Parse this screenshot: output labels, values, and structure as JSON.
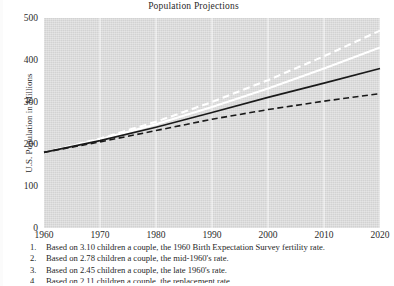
{
  "chart_data": {
    "type": "line",
    "title": "Population Projections",
    "xlabel": "",
    "ylabel": "U.S. Population in Millions",
    "xlim": [
      1960,
      2020
    ],
    "ylim": [
      0,
      500
    ],
    "grid": true,
    "legend_position": "below-axes-numbered",
    "x": [
      1960,
      1970,
      1980,
      1990,
      2000,
      2010,
      2020
    ],
    "xticklabels": [
      "1960",
      "1970",
      "1980",
      "1990",
      "2000",
      "2010",
      "2020"
    ],
    "yticklabels": [
      "0",
      "100",
      "200",
      "300",
      "400",
      "500"
    ],
    "yticks": [
      0,
      100,
      200,
      300,
      400,
      500
    ],
    "series": [
      {
        "name": "1",
        "label": "Based on 3.10 children a couple, the 1960 Birth Expectation Survey fertility rate.",
        "style": "dashed",
        "color": "#ffffff",
        "values": [
          180,
          213,
          253,
          300,
          352,
          409,
          470
        ]
      },
      {
        "name": "2",
        "label": "Based on 2.78 children a couple, the mid-1960's rate.",
        "style": "solid",
        "color": "#ffffff",
        "values": [
          180,
          211,
          247,
          288,
          332,
          380,
          430
        ]
      },
      {
        "name": "3",
        "label": "Based on 2.45 children a couple, the late 1960's rate.",
        "style": "solid",
        "color": "#1a1a1a",
        "values": [
          180,
          208,
          240,
          275,
          311,
          345,
          380
        ]
      },
      {
        "name": "4",
        "label": "Based on 2.11 children a couple, the replacement rate.",
        "style": "dashed",
        "color": "#1a1a1a",
        "values": [
          180,
          205,
          232,
          259,
          282,
          302,
          320
        ]
      }
    ]
  },
  "footnotes": [
    {
      "num": "1.",
      "text": "Based on 3.10 children a couple, the 1960 Birth Expectation Survey fertility rate."
    },
    {
      "num": "2.",
      "text": "Based on 2.78 children a couple, the mid-1960's rate."
    },
    {
      "num": "3.",
      "text": "Based on 2.45 children a couple, the late 1960's rate."
    },
    {
      "num": "4.",
      "text": "Based on 2.11 children a couple, the replacement rate."
    }
  ]
}
